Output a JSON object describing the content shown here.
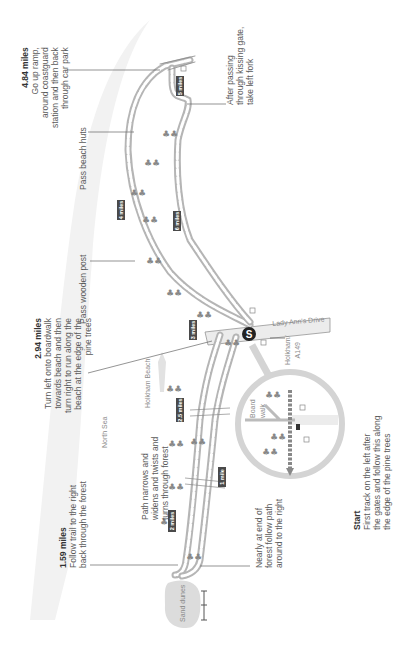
{
  "map": {
    "orientation": "rotated 90deg counter-clockwise",
    "colors": {
      "path": "#9a9a9a",
      "beach": "#f0f0f0",
      "road": "#e8e8e8",
      "milebox": "#4a4a4a",
      "leader": "#666666",
      "start": "#222222"
    },
    "annotations": [
      {
        "id": "a484",
        "distance": "4.84 miles",
        "lines": [
          "Go up ramp,",
          "around coastguard",
          "station and then back",
          "through car park"
        ]
      },
      {
        "id": "a294",
        "distance": "2.94 miles",
        "lines": [
          "Turn left onto boardwalk",
          "towards beach and then",
          "turn right to run along the",
          "beach at the edge of the",
          "pine trees"
        ]
      },
      {
        "id": "a159",
        "distance": "1.59 miles",
        "lines": [
          "Follow trail to the right",
          "back through the forest"
        ]
      },
      {
        "id": "start",
        "distance": "Start",
        "lines": [
          "First track on the left after",
          "the gates and follow this along",
          "the edge of the pine trees"
        ]
      },
      {
        "id": "kissing",
        "distance": "",
        "lines": [
          "After passing",
          "through kissing gate,",
          "take left fork"
        ]
      },
      {
        "id": "huts",
        "distance": "",
        "lines": [
          "Pass beach huts"
        ]
      },
      {
        "id": "post",
        "distance": "",
        "lines": [
          "Pass wooden post"
        ]
      },
      {
        "id": "narrow",
        "distance": "",
        "lines": [
          "Path narrows and",
          "widens and twists and",
          "turns through forest"
        ]
      },
      {
        "id": "nearly",
        "distance": "",
        "lines": [
          "Nearly at end of",
          "forest follow path",
          "around to the right"
        ]
      }
    ],
    "place_labels": {
      "north_sea": "North Sea",
      "holkham_beach": "Holkham Beach",
      "lady_anns_drive": "Lady Ann's Drive",
      "holkham_a149": [
        "Holkham/",
        "A149"
      ],
      "sand_dunes": "Sand dunes",
      "board_walk": [
        "Board",
        "walk"
      ],
      "start_marker": "S"
    },
    "mile_markers": [
      "1 mile",
      "2 miles",
      "2.5 miles",
      "3 miles",
      "4 miles",
      "5 miles",
      "6 miles"
    ]
  }
}
